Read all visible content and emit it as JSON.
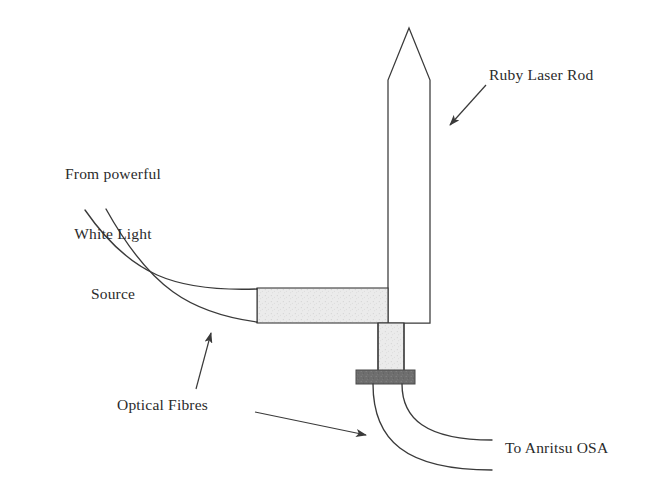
{
  "diagram": {
    "background_color": "#ffffff",
    "stroke_color": "#3a3a3a",
    "fibre_fill_color": "#e9e9e9",
    "clamp_fill_color": "#6e6e6e",
    "labels": {
      "source": {
        "line1": "From powerful",
        "line2": "White Light",
        "line3": "Source"
      },
      "rod": "Ruby Laser Rod",
      "fibres": "Optical Fibres",
      "osa": "To Anritsu OSA"
    },
    "parts": {
      "laser_rod": "Ruby Laser Rod",
      "input_fibre_bundle": "Input optical fibre bundle",
      "input_fibre_ferrule": "Input fibre ferrule",
      "output_fibre_stub": "Output fibre stub",
      "fibre_clamp": "Fibre clamp block",
      "output_fibre_upper": "Upper output fibre",
      "output_fibre_lower": "Lower output fibre"
    },
    "annotations": {
      "rod_arrow": "Pointer from Ruby Laser Rod label to rod body",
      "fibres_arrow_up": "Pointer from Optical Fibres label to input fibre bundle",
      "fibres_arrow_down": "Pointer from Optical Fibres label to output fibres"
    }
  }
}
